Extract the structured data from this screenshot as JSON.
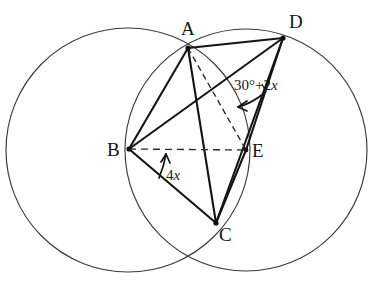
{
  "figure": {
    "stroke_color": "#1a1a1a",
    "circle_stroke_color": "#3a3a3a",
    "background": "#ffffff",
    "canvas": {
      "width": 374,
      "height": 289
    }
  },
  "circles": [
    {
      "name": "left-circle",
      "cx": 128,
      "cy": 150,
      "r": 122
    },
    {
      "name": "right-circle",
      "cx": 246,
      "cy": 150,
      "r": 121
    }
  ],
  "points": [
    {
      "id": "A",
      "label": "A",
      "x": 188,
      "y": 48,
      "label_x": 181,
      "label_y": 19
    },
    {
      "id": "D",
      "label": "D",
      "x": 283,
      "y": 38,
      "label_x": 289,
      "label_y": 12
    },
    {
      "id": "B",
      "label": "B",
      "x": 129,
      "y": 149,
      "label_x": 107,
      "label_y": 140
    },
    {
      "id": "E",
      "label": "E",
      "x": 246,
      "y": 150,
      "label_x": 252,
      "label_y": 141
    },
    {
      "id": "C",
      "label": "C",
      "x": 216,
      "y": 223,
      "label_x": 219,
      "label_y": 225
    }
  ],
  "segments": [
    {
      "name": "segment-AB",
      "from": "A",
      "to": "B",
      "style": "solid"
    },
    {
      "name": "segment-AC",
      "from": "A",
      "to": "C",
      "style": "solid"
    },
    {
      "name": "segment-AD",
      "from": "A",
      "to": "D",
      "style": "solid"
    },
    {
      "name": "segment-BC",
      "from": "B",
      "to": "C",
      "style": "solid"
    },
    {
      "name": "segment-BD",
      "from": "B",
      "to": "D",
      "style": "solid"
    },
    {
      "name": "segment-CD",
      "from": "C",
      "to": "D",
      "style": "solid"
    },
    {
      "name": "segment-CE",
      "from": "C",
      "to": "E",
      "style": "solid"
    },
    {
      "name": "segment-DE",
      "from": "D",
      "to": "E",
      "style": "solid"
    },
    {
      "name": "segment-AE",
      "from": "A",
      "to": "E",
      "style": "dashed"
    },
    {
      "name": "segment-BE",
      "from": "B",
      "to": "E",
      "style": "dashed"
    }
  ],
  "angles": [
    {
      "name": "angle-at-E",
      "vertex": "E",
      "text_plain": "30°+2x",
      "text_prefix": "30°+2",
      "text_variable": "x",
      "label_x": 234,
      "label_y": 78,
      "between": [
        "E-A",
        "E-D"
      ]
    },
    {
      "name": "angle-at-B",
      "vertex": "B",
      "text_plain": "4x",
      "text_prefix": "4",
      "text_variable": "x",
      "label_x": 166,
      "label_y": 168,
      "between": [
        "B-C",
        "B-E"
      ]
    }
  ]
}
